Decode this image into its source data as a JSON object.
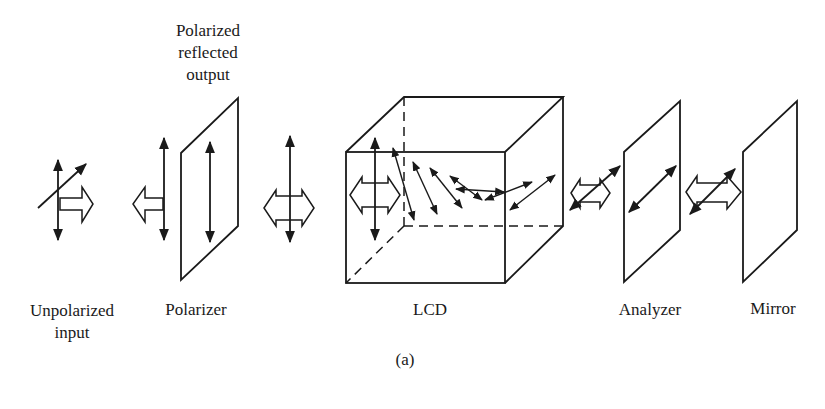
{
  "figure": {
    "top_label": [
      "Polarized",
      "reflected",
      "output"
    ],
    "labels": {
      "unpolarized": [
        "Unpolarized",
        "input"
      ],
      "polarizer": "Polarizer",
      "lcd": "LCD",
      "analyzer": "Analyzer",
      "mirror": "Mirror"
    },
    "caption": "(a)"
  },
  "colors": {
    "ink": "#1a1a1a",
    "background": "#ffffff"
  }
}
